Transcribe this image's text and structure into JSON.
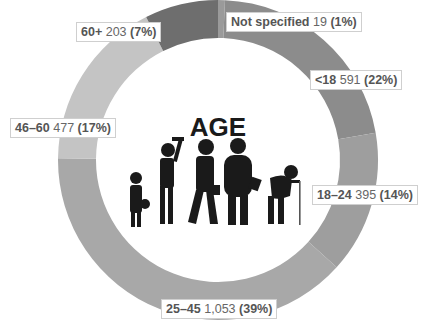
{
  "chart_data": {
    "type": "pie",
    "variant": "donut",
    "title": "AGE",
    "categories": [
      "Not specified",
      "<18",
      "18–24",
      "25–45",
      "46–60",
      "60+"
    ],
    "values": [
      19,
      591,
      395,
      1053,
      477,
      203
    ],
    "value_labels": [
      "19",
      "591",
      "395",
      "1,053",
      "477",
      "203"
    ],
    "percentages": [
      "1%",
      "22%",
      "14%",
      "39%",
      "17%",
      "7%"
    ],
    "colors": [
      "#9a9a9a",
      "#8c8c8c",
      "#9e9e9e",
      "#a8a8a8",
      "#c4c4c4",
      "#6e6e6e"
    ],
    "center_graphic": "age-progression-silhouettes"
  },
  "labels": [
    {
      "cat": "60+",
      "val": "203",
      "pct": "(7%)"
    },
    {
      "cat": "Not specified",
      "val": "19",
      "pct": "(1%)"
    },
    {
      "cat": "<18",
      "val": "591",
      "pct": "(22%)"
    },
    {
      "cat": "46–60",
      "val": "477",
      "pct": "(17%)"
    },
    {
      "cat": "18–24",
      "val": "395",
      "pct": "(14%)"
    },
    {
      "cat": "25–45",
      "val": "1,053",
      "pct": "(39%)"
    }
  ]
}
